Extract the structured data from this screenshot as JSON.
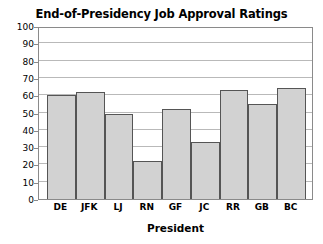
{
  "chart_data": {
    "type": "bar",
    "title": "End-of-Presidency Job Approval Ratings",
    "xlabel": "President",
    "ylabel": "",
    "categories": [
      "DE",
      "JFK",
      "LJ",
      "RN",
      "GF",
      "JC",
      "RR",
      "GB",
      "BC"
    ],
    "values": [
      60,
      62,
      49,
      22,
      52,
      33,
      63,
      55,
      64
    ],
    "ylim": [
      0,
      100
    ],
    "yticks": [
      0,
      10,
      20,
      30,
      40,
      50,
      60,
      70,
      80,
      90,
      100
    ],
    "ytick_labels": [
      "0",
      "10",
      "20",
      "30",
      "40",
      "50",
      "60",
      "70",
      "80",
      "90",
      "100"
    ],
    "grid": true,
    "legend": "none",
    "bar_color": "#d2d2d2",
    "bar_edge_color": "#555555",
    "gridline_color": "#b9b9b9",
    "axis_color": "#8a8a8a",
    "text_color": "#000000",
    "background": "#ffffff"
  }
}
